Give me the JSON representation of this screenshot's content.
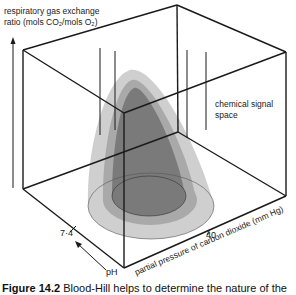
{
  "figure": {
    "y_axis_label_line1": "respiratory gas exchange",
    "y_axis_label_line2": "ratio (mols CO₂/mols O₂)",
    "region_label_line1": "chemical signal",
    "region_label_line2": "space",
    "x_axis_label": "partial pressure of carbon dioxide (mm Hg)",
    "z_axis_label": "pH",
    "ph_tick": "7·4",
    "pco2_tick": "40",
    "colors": {
      "line": "#1a1a1a",
      "outer_cone": "#c9c9c9",
      "middle_cone": "#a8a8a8",
      "inner_cone": "#6f6f6f",
      "background": "#ffffff"
    }
  },
  "caption": {
    "number": "Figure 14.2",
    "text": "Blood-Hill helps to determine the nature of the"
  }
}
